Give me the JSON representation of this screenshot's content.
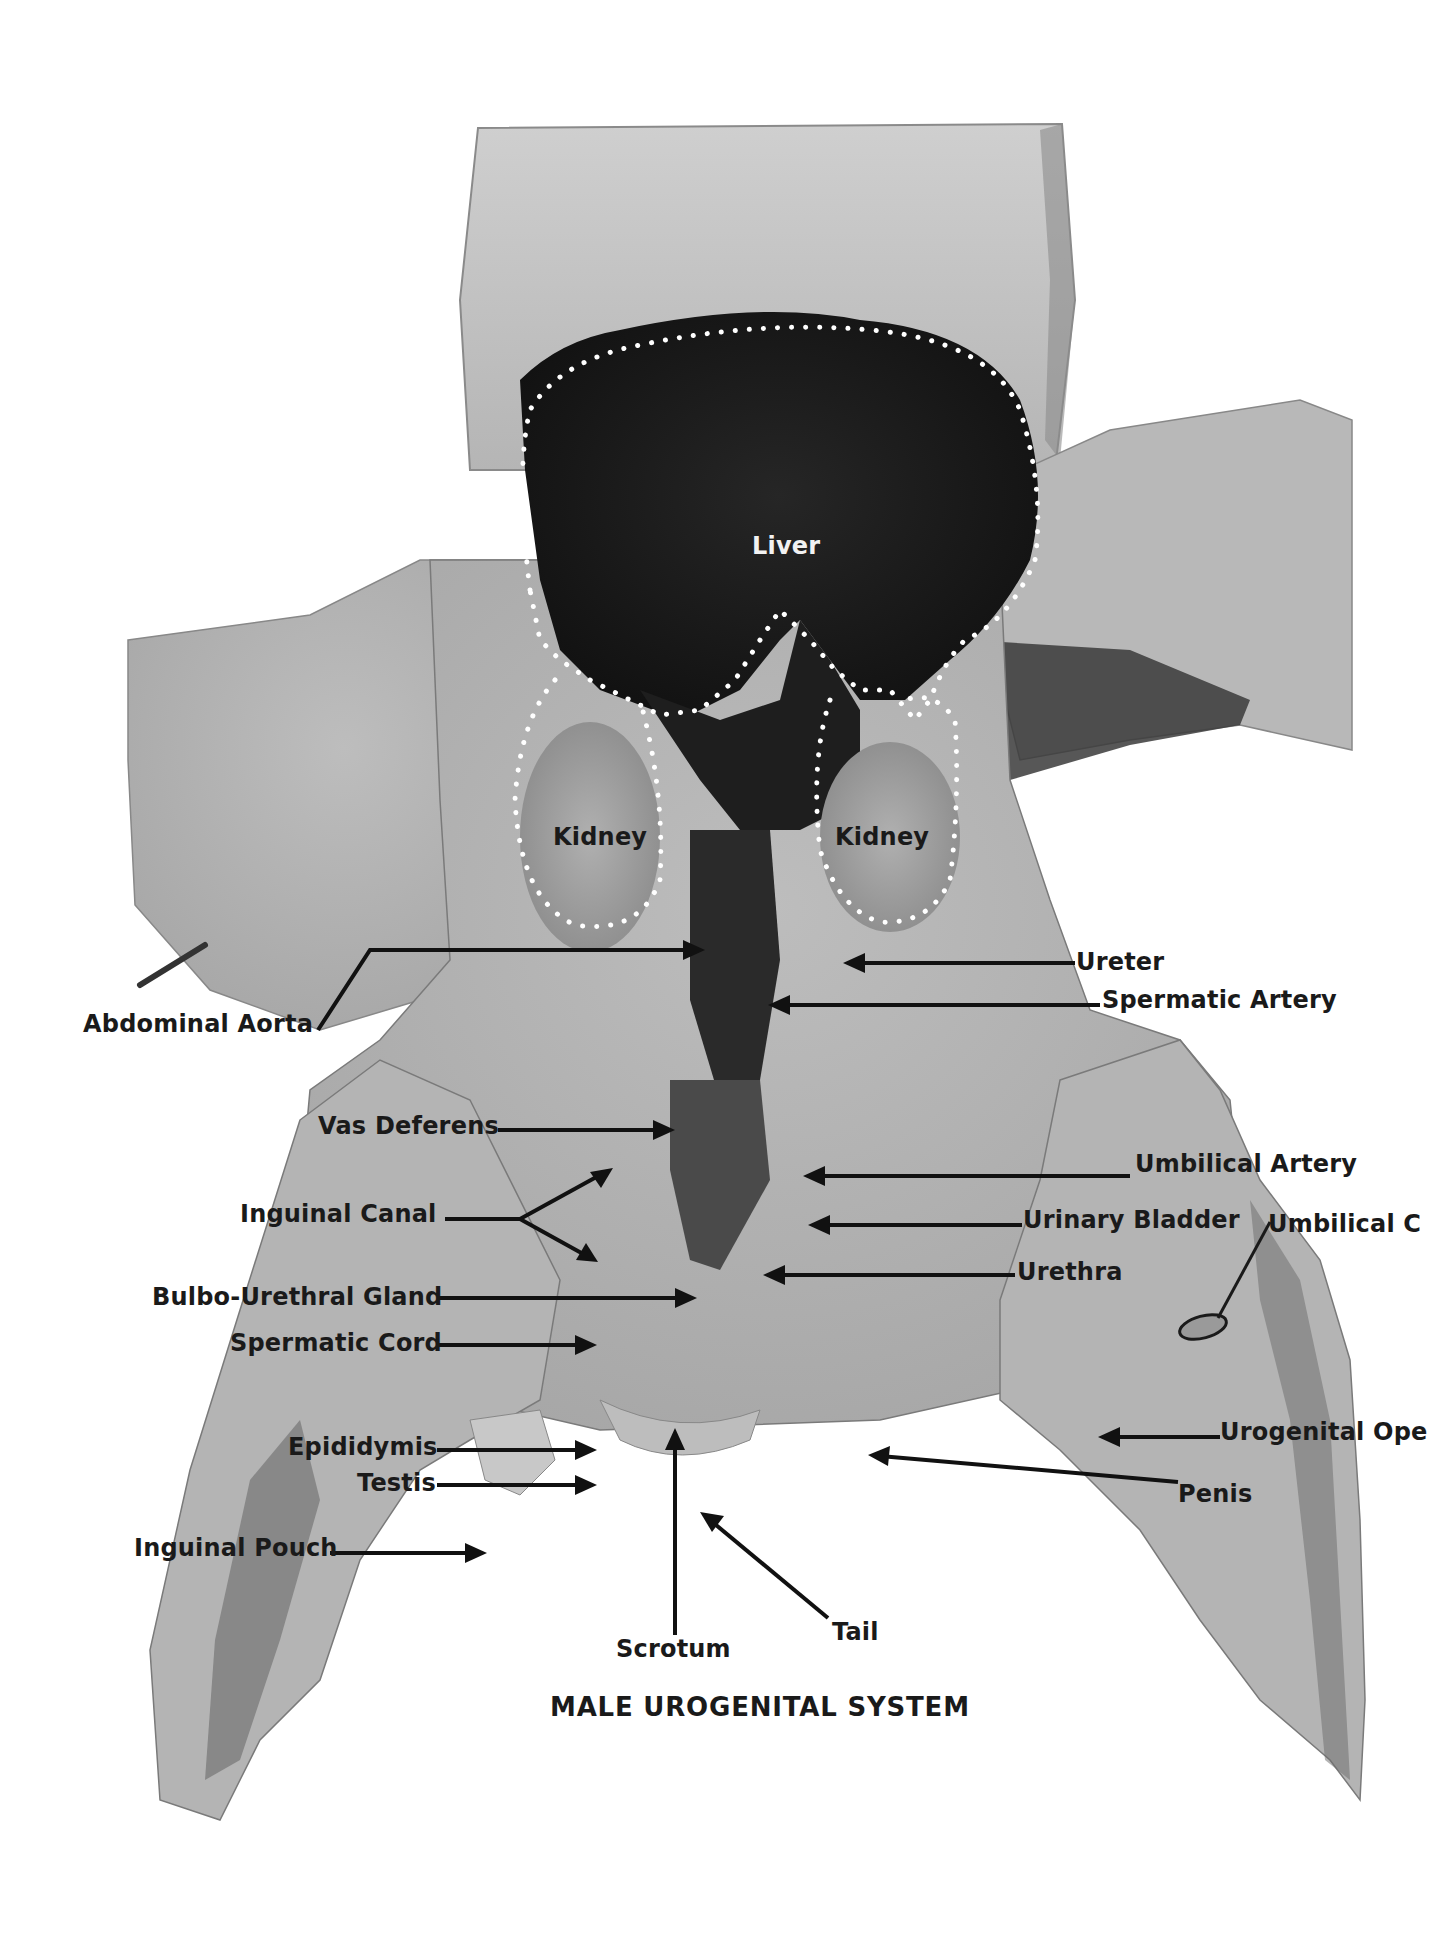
{
  "figure": {
    "title": "MALE UROGENITAL SYSTEM",
    "colors": {
      "background": "#ffffff",
      "tissue_light": "#c9c9c9",
      "tissue_mid": "#9a9a9a",
      "tissue_dark": "#2a2a2a",
      "label_text": "#1a1a1a",
      "dotted_outline": "#ffffff"
    }
  },
  "labels": [
    {
      "id": "liver",
      "text": "Liver",
      "color": "white"
    },
    {
      "id": "kidney-left",
      "text": "Kidney",
      "color": "dark"
    },
    {
      "id": "kidney-right",
      "text": "Kidney",
      "color": "dark"
    },
    {
      "id": "ureter",
      "text": "Ureter",
      "color": "dark"
    },
    {
      "id": "spermatic-artery",
      "text": "Spermatic Artery",
      "color": "dark"
    },
    {
      "id": "abdominal-aorta",
      "text": "Abdominal Aorta",
      "color": "dark"
    },
    {
      "id": "vas-deferens",
      "text": "Vas Deferens",
      "color": "dark"
    },
    {
      "id": "umbilical-artery",
      "text": "Umbilical Artery",
      "color": "dark"
    },
    {
      "id": "inguinal-canal",
      "text": "Inguinal Canal",
      "color": "dark"
    },
    {
      "id": "urinary-bladder",
      "text": "Urinary Bladder",
      "color": "dark"
    },
    {
      "id": "umbilical-cord",
      "text": "Umbilical C",
      "color": "dark"
    },
    {
      "id": "bulbo-urethral-gland",
      "text": "Bulbo-Urethral Gland",
      "color": "dark"
    },
    {
      "id": "urethra",
      "text": "Urethra",
      "color": "dark"
    },
    {
      "id": "spermatic-cord",
      "text": "Spermatic Cord",
      "color": "dark"
    },
    {
      "id": "epididymis",
      "text": "Epididymis",
      "color": "dark"
    },
    {
      "id": "urogenital-opening",
      "text": "Urogenital Ope",
      "color": "dark"
    },
    {
      "id": "testis",
      "text": "Testis",
      "color": "dark"
    },
    {
      "id": "penis",
      "text": "Penis",
      "color": "dark"
    },
    {
      "id": "inguinal-pouch",
      "text": "Inguinal Pouch",
      "color": "dark"
    },
    {
      "id": "scrotum",
      "text": "Scrotum",
      "color": "dark"
    },
    {
      "id": "tail",
      "text": "Tail",
      "color": "dark"
    }
  ]
}
